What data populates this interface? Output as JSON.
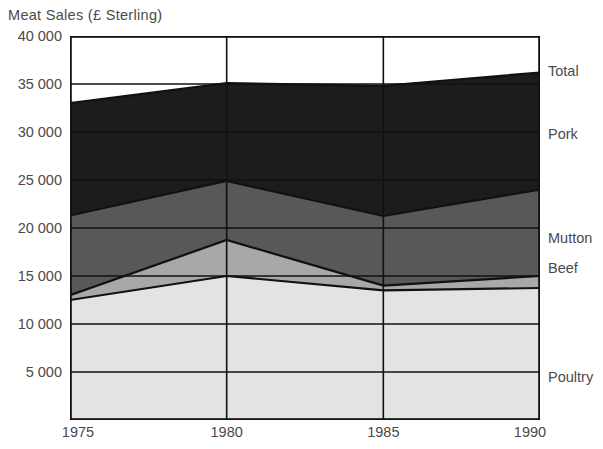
{
  "chart_data": {
    "type": "area",
    "title": "Meat Sales (£ Sterling)",
    "xlabel": "",
    "ylabel": "Meat Sales (£ Sterling)",
    "stacked": true,
    "grid": true,
    "legend_position": "right",
    "x": [
      1975,
      1980,
      1985,
      1990
    ],
    "xlim": [
      1975,
      1990
    ],
    "ylim": [
      0,
      40000
    ],
    "ytick_values": [
      5000,
      10000,
      15000,
      20000,
      25000,
      30000,
      35000,
      40000
    ],
    "ytick_labels": [
      "5 000",
      "10 000",
      "15 000",
      "20 000",
      "25 000",
      "30 000",
      "35 000",
      "40 000"
    ],
    "xtick_labels": [
      "1975",
      "1980",
      "1985",
      "1990"
    ],
    "series": [
      {
        "name": "Poultry",
        "values": [
          12500,
          15000,
          13500,
          13750
        ],
        "color": "#e3e3e3"
      },
      {
        "name": "Beef",
        "values": [
          500,
          3750,
          500,
          1250
        ],
        "color": "#a8a8a8"
      },
      {
        "name": "Mutton",
        "values": [
          8300,
          6150,
          7250,
          9000
        ],
        "color": "#585858"
      },
      {
        "name": "Pork",
        "values": [
          11700,
          10200,
          13550,
          12200
        ],
        "color": "#1c1c1c"
      }
    ],
    "cumulative": {
      "poultry_top": [
        12500,
        15000,
        13500,
        13750
      ],
      "beef_top": [
        13000,
        18750,
        14000,
        15000
      ],
      "mutton_top": [
        21300,
        24900,
        21250,
        24000
      ],
      "total": [
        33000,
        35100,
        34800,
        36200
      ]
    },
    "total_label": "Total"
  },
  "legend": {
    "items": [
      {
        "label": "Total",
        "y": 71
      },
      {
        "label": "Pork",
        "y": 134
      },
      {
        "label": "Mutton",
        "y": 238
      },
      {
        "label": "Beef",
        "y": 268
      },
      {
        "label": "Poultry",
        "y": 377
      }
    ]
  },
  "axis": {
    "y_positions_px": [
      372,
      324,
      276,
      228,
      180,
      132,
      84,
      36
    ],
    "x_positions_px": [
      70,
      227,
      384,
      541
    ]
  },
  "colors": {
    "poultry": "#e3e3e3",
    "beef": "#a8a8a8",
    "mutton": "#585858",
    "pork": "#1c1c1c",
    "background": "#ffffff",
    "line": "#111111",
    "text": "#4a4a4a"
  }
}
